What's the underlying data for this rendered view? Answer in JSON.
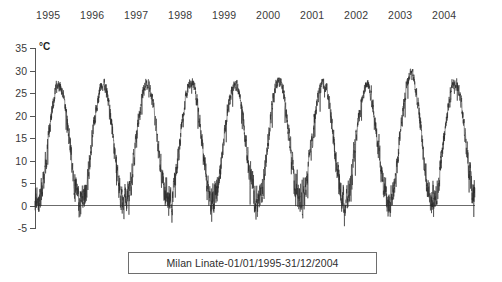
{
  "caption": {
    "text": "Milan Linate-01/01/1995-31/12/2004"
  },
  "axes": {
    "unit_label": "°C"
  },
  "chart_data": {
    "type": "line",
    "title": "Milan Linate-01/01/1995-31/12/2004",
    "xlabel": "",
    "ylabel": "°C",
    "ylim": [
      -5,
      35
    ],
    "ytick_labels": [
      "35",
      "30",
      "25",
      "20",
      "15",
      "10",
      "5",
      "0",
      "-5"
    ],
    "ytick_values": [
      35,
      30,
      25,
      20,
      15,
      10,
      5,
      0,
      -5
    ],
    "ytick_step": 5,
    "xtick_labels": [
      "1995",
      "1996",
      "1997",
      "1998",
      "1999",
      "2000",
      "2001",
      "2002",
      "2003",
      "2004"
    ],
    "xtick_values": [
      1995,
      1996,
      1997,
      1998,
      1999,
      2000,
      2001,
      2002,
      2003,
      2004
    ],
    "xaxis_position": "top",
    "grid": false,
    "legend": false,
    "zero_line": true,
    "series_color": "#2b2b2b",
    "zero_line_color": "#6b6b6b",
    "axis_color": "#555555",
    "series": [
      {
        "name": "Daily mean temperature",
        "sampling": "daily",
        "n_points": 3653,
        "units": "°C",
        "annual_cycle": {
          "summer_peak_range": [
            29,
            33
          ],
          "winter_min_range": [
            -4,
            2
          ],
          "peak_month": "July",
          "trough_month": "January"
        },
        "yearly_summary": [
          {
            "year": 1995,
            "max": 30.0,
            "min": -2.5,
            "mean": 13.5
          },
          {
            "year": 1996,
            "max": 30.5,
            "min": -3.0,
            "mean": 13.2
          },
          {
            "year": 1997,
            "max": 30.0,
            "min": -2.0,
            "mean": 13.8
          },
          {
            "year": 1998,
            "max": 31.0,
            "min": -2.5,
            "mean": 13.9
          },
          {
            "year": 1999,
            "max": 30.0,
            "min": -1.5,
            "mean": 14.0
          },
          {
            "year": 2000,
            "max": 31.0,
            "min": -3.0,
            "mean": 14.2
          },
          {
            "year": 2001,
            "max": 30.5,
            "min": -2.0,
            "mean": 14.0
          },
          {
            "year": 2002,
            "max": 30.0,
            "min": -2.5,
            "mean": 14.3
          },
          {
            "year": 2003,
            "max": 33.0,
            "min": -3.5,
            "mean": 14.8
          },
          {
            "year": 2004,
            "max": 30.5,
            "min": -2.0,
            "mean": 13.9
          }
        ],
        "monthly_means": [
          2.0,
          4.5,
          9.0,
          13.0,
          18.0,
          22.0,
          25.0,
          24.5,
          20.0,
          14.0,
          8.0,
          3.0
        ]
      }
    ]
  }
}
